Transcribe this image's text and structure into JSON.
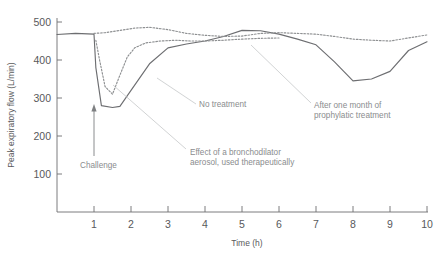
{
  "chart_data": {
    "type": "line",
    "title": "",
    "xlabel": "Time (h)",
    "ylabel": "Peak expiratory flow (L/min)",
    "xlim": [
      0,
      10
    ],
    "ylim": [
      0,
      500
    ],
    "xticks": [
      1,
      2,
      3,
      4,
      5,
      6,
      7,
      8,
      9,
      10
    ],
    "yticks": [
      100,
      200,
      300,
      400,
      500
    ],
    "xtick_labels": [
      "1",
      "2",
      "3",
      "4",
      "5",
      "6",
      "7",
      "8",
      "9",
      "10"
    ],
    "ytick_labels": [
      "100",
      "200",
      "300",
      "400",
      "500"
    ],
    "grid": false,
    "legend": "annotations",
    "series": [
      {
        "name": "No treatment",
        "style": "solid",
        "color": "#6d6e71",
        "x": [
          0.0,
          0.5,
          1.0,
          1.05,
          1.2,
          1.5,
          1.7,
          2.0,
          2.5,
          3.0,
          3.5,
          4.0,
          4.5,
          5.0,
          5.5,
          6.0,
          6.5,
          7.0,
          7.5,
          8.0,
          8.5,
          9.0,
          9.5,
          10.0
        ],
        "y": [
          467,
          470,
          468,
          380,
          280,
          275,
          278,
          320,
          390,
          432,
          442,
          450,
          462,
          478,
          477,
          468,
          455,
          440,
          395,
          345,
          350,
          370,
          425,
          448
        ]
      },
      {
        "name": "Effect of a bronchodilator aerosol, used therapeutically",
        "style": "dotted",
        "color": "#8e9092",
        "x": [
          1.05,
          1.15,
          1.3,
          1.5,
          1.7,
          1.9,
          2.1,
          2.4,
          2.8,
          3.2,
          3.6,
          4.0,
          4.5,
          5.0,
          5.5,
          6.0
        ],
        "y": [
          452,
          400,
          330,
          310,
          360,
          408,
          432,
          445,
          450,
          452,
          450,
          450,
          452,
          455,
          457,
          458
        ]
      },
      {
        "name": "After one month of prophylatic treatment",
        "style": "dotted",
        "color": "#8e9092",
        "x": [
          1.0,
          1.3,
          1.7,
          2.1,
          2.5,
          3.0,
          3.5,
          4.0,
          4.5,
          5.0,
          5.5,
          6.0,
          6.5,
          7.0,
          7.5,
          8.0,
          8.5,
          9.0,
          9.5,
          10.0
        ],
        "y": [
          470,
          472,
          478,
          484,
          486,
          480,
          470,
          465,
          462,
          463,
          470,
          472,
          470,
          468,
          462,
          455,
          452,
          450,
          458,
          466
        ]
      }
    ],
    "annotations": [
      {
        "id": "challenge",
        "label": "Challenge",
        "kind": "arrow",
        "x": 1.0,
        "y_from": 175,
        "y_to": 255
      },
      {
        "id": "no-treatment",
        "label": "No treatment",
        "kind": "leader",
        "point_x": 2.6,
        "point_y": 405
      },
      {
        "id": "bronchodilator",
        "label_line1": "Effect of a bronchodilator",
        "label_line2": "aerosol, used therapeutically",
        "kind": "leader",
        "point_x": 1.55,
        "point_y": 348
      },
      {
        "id": "prophylatic",
        "label_line1": "After one month of",
        "label_line2": "prophylatic treatment",
        "kind": "leader",
        "point_x": 5.25,
        "point_y": 455
      }
    ]
  }
}
